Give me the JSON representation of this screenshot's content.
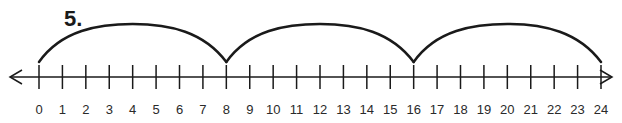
{
  "problem": {
    "number_label": "5."
  },
  "number_line": {
    "min": 0,
    "max": 24,
    "step": 1,
    "tick_labels": [
      "0",
      "1",
      "2",
      "3",
      "4",
      "5",
      "6",
      "7",
      "8",
      "9",
      "10",
      "11",
      "12",
      "13",
      "14",
      "15",
      "16",
      "17",
      "18",
      "19",
      "20",
      "21",
      "22",
      "23",
      "24"
    ],
    "arrows": {
      "left": "left-arrow",
      "right": "right-arrow"
    }
  },
  "jumps": [
    {
      "from": 0,
      "to": 8
    },
    {
      "from": 8,
      "to": 16
    },
    {
      "from": 16,
      "to": 24
    }
  ],
  "colors": {
    "line": "#1a1a1a",
    "background": "#ffffff"
  }
}
